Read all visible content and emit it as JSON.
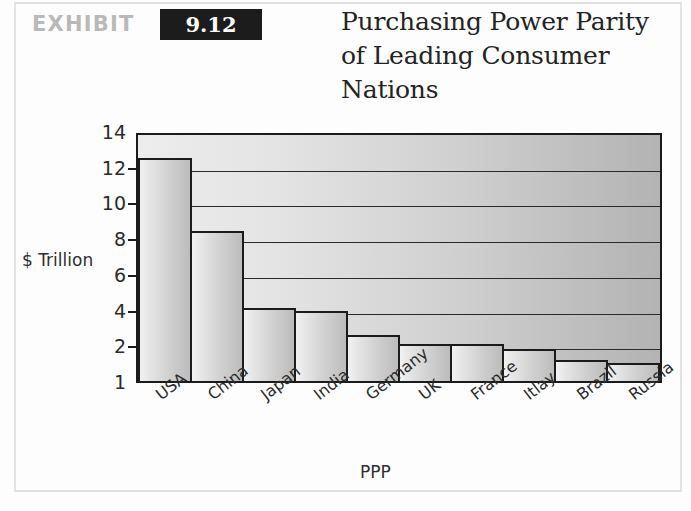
{
  "exhibit": {
    "label": "EXHIBIT",
    "number": "9.12",
    "title": "Purchasing Power Parity of Leading Consumer Nations"
  },
  "colors": {
    "badge_background": "#1c1c1c",
    "badge_text": "#ffffff",
    "exhibit_label": "#b9b9b9",
    "title_text": "#232323",
    "axis": "#1b1b1b",
    "plot_fill_light": "#ededed",
    "plot_fill_dark": "#b3b3b3",
    "bar_fill_light": "#f2f2f2",
    "bar_fill_dark": "#bcbcbc",
    "frame": "#e2e2e2"
  },
  "chart_data": {
    "type": "bar",
    "title": "Purchasing Power Parity of Leading Consumer Nations",
    "xlabel": "PPP",
    "ylabel": "$ Trillion",
    "categories": [
      "USA",
      "China",
      "Japan",
      "India",
      "Germany",
      "UK",
      "France",
      "Itlay",
      "Brazil",
      "Russia"
    ],
    "values": [
      12.5,
      8.4,
      4.1,
      3.9,
      2.6,
      2.1,
      2.1,
      1.9,
      1.6,
      1.5
    ],
    "yticks": [
      14,
      12,
      10,
      8,
      6,
      4,
      2,
      1
    ],
    "ylim": [
      1,
      14
    ],
    "grid": true,
    "legend": false,
    "xtick_rotation": -38
  }
}
